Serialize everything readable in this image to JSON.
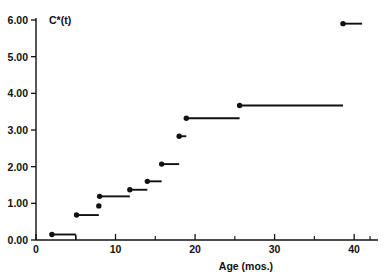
{
  "chart_data": {
    "type": "line",
    "subtype": "step-function",
    "title": "",
    "series_label": "C*(t)",
    "xlabel": "Age (mos.)",
    "ylabel": "",
    "xlim": [
      0,
      43
    ],
    "ylim": [
      0,
      6.0
    ],
    "grid": false,
    "legend": "none",
    "x_ticks_major": [
      0,
      10,
      20,
      30,
      40
    ],
    "x_tick_labels": [
      "0",
      "10",
      "20",
      "30",
      "40"
    ],
    "x_ticks_minor": [
      5,
      15,
      25,
      35,
      42
    ],
    "y_ticks_major": [
      0.0,
      1.0,
      2.0,
      3.0,
      4.0,
      5.0,
      6.0
    ],
    "y_tick_labels": [
      "0.00",
      "1.00",
      "2.00",
      "3.00",
      "4.00",
      "5.00",
      "6.00"
    ],
    "marker": "filled-circle",
    "steps": [
      {
        "x_start": 2.0,
        "x_end": 5.0,
        "y": 0.15,
        "drop_to_zero": true
      },
      {
        "x_start": 5.1,
        "x_end": 7.9,
        "y": 0.68,
        "drop_to_zero": false
      },
      {
        "x_start": 7.9,
        "x_end": 8.0,
        "y": 0.93,
        "drop_to_zero": false
      },
      {
        "x_start": 8.0,
        "x_end": 11.8,
        "y": 1.19,
        "drop_to_zero": false
      },
      {
        "x_start": 11.8,
        "x_end": 14.0,
        "y": 1.37,
        "drop_to_zero": false
      },
      {
        "x_start": 14.0,
        "x_end": 15.8,
        "y": 1.6,
        "drop_to_zero": false
      },
      {
        "x_start": 15.8,
        "x_end": 18.0,
        "y": 2.07,
        "drop_to_zero": false
      },
      {
        "x_start": 18.0,
        "x_end": 18.9,
        "y": 2.83,
        "drop_to_zero": false
      },
      {
        "x_start": 18.9,
        "x_end": 25.6,
        "y": 3.32,
        "drop_to_zero": false
      },
      {
        "x_start": 25.6,
        "x_end": 38.6,
        "y": 3.67,
        "drop_to_zero": false
      },
      {
        "x_start": 38.6,
        "x_end": 41.0,
        "y": 5.9,
        "drop_to_zero": false
      }
    ],
    "values": [
      0.15,
      0.68,
      0.93,
      1.19,
      1.37,
      1.6,
      2.07,
      2.83,
      3.32,
      3.67,
      5.9
    ],
    "x": [
      2.0,
      5.1,
      7.9,
      8.0,
      11.8,
      14.0,
      15.8,
      18.0,
      18.9,
      25.6,
      38.6
    ],
    "colors": {
      "line": "#111111",
      "marker": "#111111",
      "axis": "#111111",
      "background": "#ffffff"
    }
  }
}
